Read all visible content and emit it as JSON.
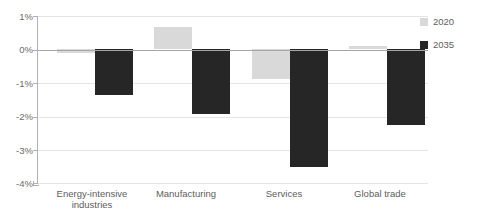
{
  "chart_data": {
    "type": "bar",
    "title": "scenario in 2035",
    "xlabel": "",
    "ylabel": "",
    "ylim": [
      -4,
      1
    ],
    "yticks": [
      1,
      0,
      -1,
      -2,
      -3,
      -4
    ],
    "ytick_labels": [
      "1%",
      "0%",
      "-1%",
      "-2%",
      "-3%",
      "-4%"
    ],
    "grid": true,
    "legend_position": "right",
    "categories": [
      "Energy-intensive industries",
      "Manufacturing",
      "Services",
      "Global trade"
    ],
    "category_lines": [
      [
        "Energy-intensive",
        "industries"
      ],
      [
        "Manufacturing"
      ],
      [
        "Services"
      ],
      [
        "Global trade"
      ]
    ],
    "series": [
      {
        "name": "2020",
        "color": "#d9d9d9",
        "values": [
          -0.12,
          0.68,
          -0.9,
          0.1
        ]
      },
      {
        "name": "2035",
        "color": "#262626",
        "values": [
          -1.37,
          -1.92,
          -3.52,
          -2.25
        ]
      }
    ]
  },
  "legend": {
    "items": [
      {
        "label": "2020",
        "color": "#d9d9d9"
      },
      {
        "label": "2035",
        "color": "#262626"
      }
    ]
  },
  "axis": {
    "y_labels": [
      "1%",
      "0%",
      "-1%",
      "-2%",
      "-3%",
      "-4%"
    ]
  }
}
